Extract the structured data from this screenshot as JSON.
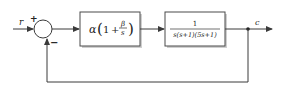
{
  "diagram": {
    "type": "feedback-control-block-diagram",
    "input_label": "r",
    "output_label": "c",
    "summing_junction": {
      "plus_sign": "+",
      "minus_sign": "−"
    },
    "controller_block": {
      "prefix": "α",
      "open_paren": "(",
      "one": "1",
      "plus": "+",
      "numerator": "β",
      "denominator": "s",
      "close_paren": ")"
    },
    "plant_block": {
      "numerator": "1",
      "denominator": "s(s+1)(5s+1)"
    },
    "feedback": "unity negative feedback",
    "colors": {
      "line": "#3a3a3a",
      "block_border": "#4a4a4a",
      "block_shadow": "#c8c8c8",
      "background": "#ffffff"
    }
  }
}
